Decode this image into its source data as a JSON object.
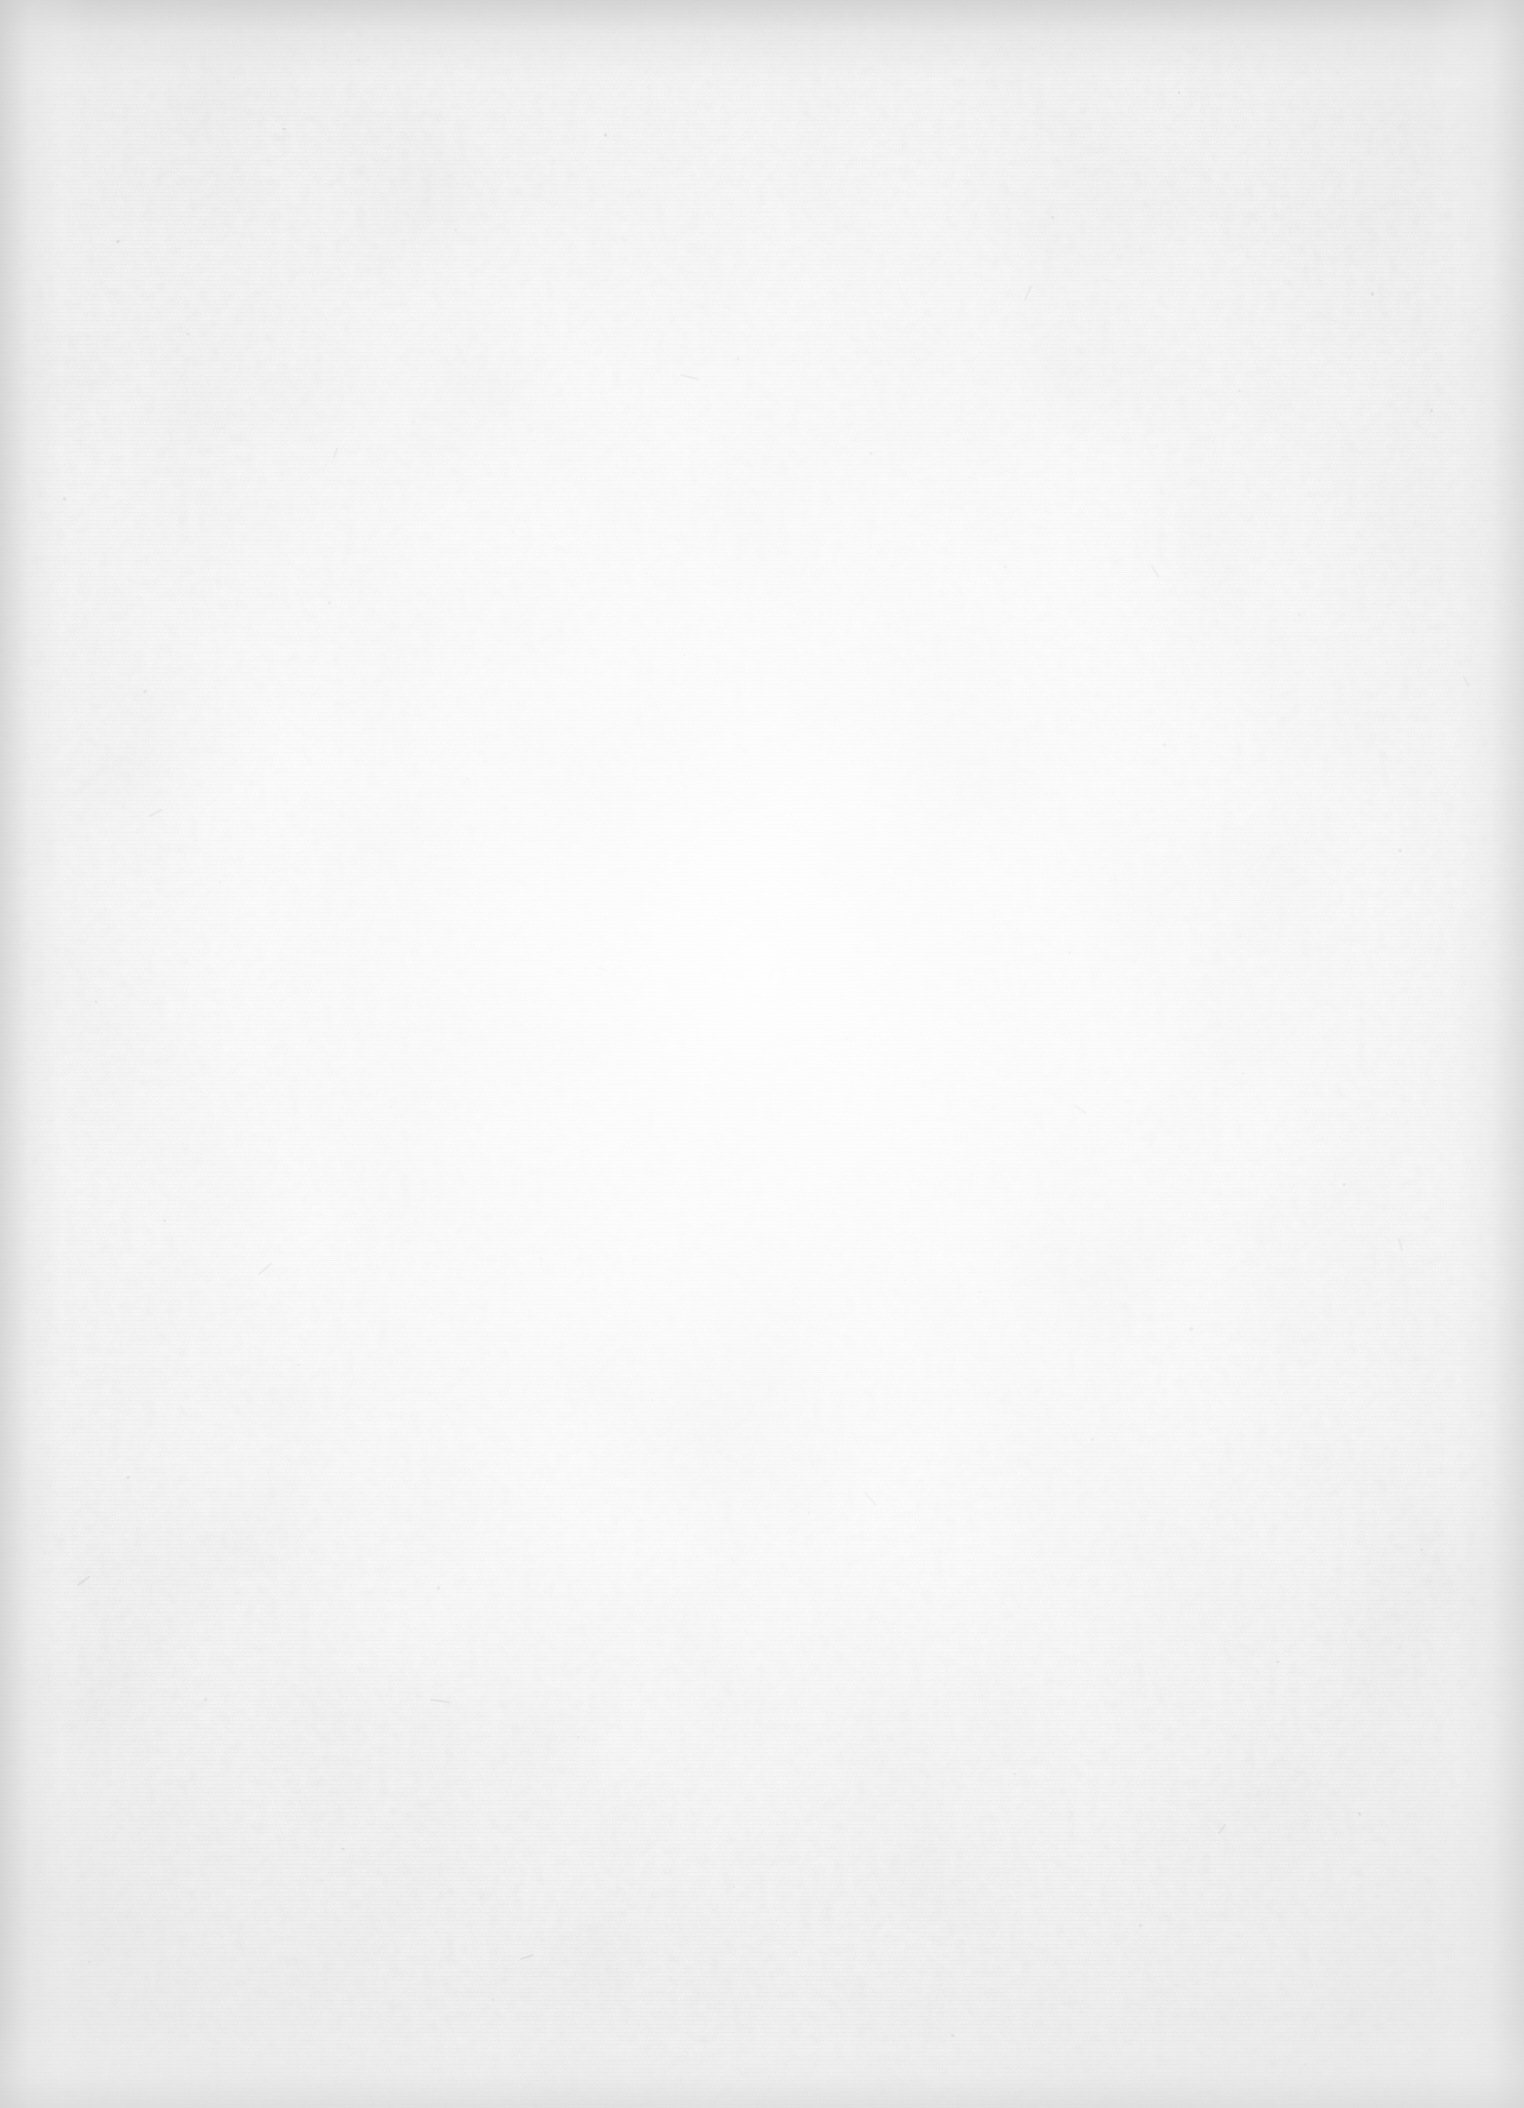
{
  "page": {
    "kind": "scanned-blank-page",
    "content_text": "",
    "visible_text_count": 0,
    "width_px": 1524,
    "height_px": 2108,
    "orientation": "portrait"
  },
  "appearance": {
    "paper_base_color": "#fcfcfc",
    "paper_center_color": "#fdfdfd",
    "paper_edge_color": "#e8e8e8",
    "corner_shadow_color": "#ececec",
    "fiber_speck_color": "#9a9a98",
    "background_color": "#ffffff"
  },
  "artifacts": {
    "vignette": "radial, brightest at center",
    "edge_shadows": [
      "top",
      "left",
      "right",
      "bottom"
    ],
    "grain": "paper fibre texture",
    "specks": "scattered dark fibre inclusions",
    "banding": "faint horizontal scanner banding"
  },
  "specks": [
    {
      "x": 604,
      "y": 133,
      "w": 3,
      "h": 4,
      "r": -22,
      "o": 0.34
    },
    {
      "x": 282,
      "y": 128,
      "w": 4,
      "h": 2,
      "r": 14,
      "o": 0.26
    },
    {
      "x": 1178,
      "y": 91,
      "w": 2,
      "h": 3,
      "r": 0,
      "o": 0.3
    },
    {
      "x": 357,
      "y": 59,
      "w": 3,
      "h": 2,
      "r": 40,
      "o": 0.24
    },
    {
      "x": 233,
      "y": 77,
      "w": 2,
      "h": 2,
      "r": 0,
      "o": 0.22
    },
    {
      "x": 116,
      "y": 240,
      "w": 4,
      "h": 3,
      "r": -35,
      "o": 0.28
    },
    {
      "x": 454,
      "y": 229,
      "w": 3,
      "h": 2,
      "r": 18,
      "o": 0.25
    },
    {
      "x": 1051,
      "y": 216,
      "w": 3,
      "h": 3,
      "r": 0,
      "o": 0.27
    },
    {
      "x": 1371,
      "y": 292,
      "w": 3,
      "h": 4,
      "r": -15,
      "o": 0.29
    },
    {
      "x": 186,
      "y": 333,
      "w": 4,
      "h": 2,
      "r": 28,
      "o": 0.23
    },
    {
      "x": 737,
      "y": 357,
      "w": 2,
      "h": 3,
      "r": 0,
      "o": 0.26
    },
    {
      "x": 1238,
      "y": 390,
      "w": 3,
      "h": 2,
      "r": -20,
      "o": 0.24
    },
    {
      "x": 412,
      "y": 421,
      "w": 2,
      "h": 2,
      "r": 0,
      "o": 0.21
    },
    {
      "x": 869,
      "y": 452,
      "w": 4,
      "h": 3,
      "r": 32,
      "o": 0.27
    },
    {
      "x": 1430,
      "y": 409,
      "w": 3,
      "h": 3,
      "r": 0,
      "o": 0.25
    },
    {
      "x": 63,
      "y": 497,
      "w": 3,
      "h": 4,
      "r": -42,
      "o": 0.28
    },
    {
      "x": 512,
      "y": 531,
      "w": 2,
      "h": 2,
      "r": 0,
      "o": 0.22
    },
    {
      "x": 1003,
      "y": 566,
      "w": 4,
      "h": 2,
      "r": 16,
      "o": 0.25
    },
    {
      "x": 328,
      "y": 601,
      "w": 3,
      "h": 3,
      "r": 0,
      "o": 0.26
    },
    {
      "x": 1298,
      "y": 613,
      "w": 2,
      "h": 3,
      "r": -12,
      "o": 0.23
    },
    {
      "x": 683,
      "y": 654,
      "w": 3,
      "h": 2,
      "r": 24,
      "o": 0.24
    },
    {
      "x": 143,
      "y": 690,
      "w": 4,
      "h": 3,
      "r": -28,
      "o": 0.29
    },
    {
      "x": 925,
      "y": 713,
      "w": 2,
      "h": 2,
      "r": 0,
      "o": 0.21
    },
    {
      "x": 1163,
      "y": 743,
      "w": 3,
      "h": 4,
      "r": 36,
      "o": 0.27
    },
    {
      "x": 466,
      "y": 778,
      "w": 3,
      "h": 2,
      "r": -18,
      "o": 0.24
    },
    {
      "x": 790,
      "y": 812,
      "w": 2,
      "h": 3,
      "r": 0,
      "o": 0.22
    },
    {
      "x": 1398,
      "y": 849,
      "w": 4,
      "h": 3,
      "r": 20,
      "o": 0.28
    },
    {
      "x": 219,
      "y": 881,
      "w": 3,
      "h": 2,
      "r": 0,
      "o": 0.23
    },
    {
      "x": 605,
      "y": 918,
      "w": 2,
      "h": 2,
      "r": 0,
      "o": 0.21
    },
    {
      "x": 1068,
      "y": 951,
      "w": 3,
      "h": 4,
      "r": -30,
      "o": 0.26
    },
    {
      "x": 94,
      "y": 1001,
      "w": 4,
      "h": 2,
      "r": 12,
      "o": 0.27
    },
    {
      "x": 845,
      "y": 1038,
      "w": 3,
      "h": 3,
      "r": 0,
      "o": 0.25
    },
    {
      "x": 1242,
      "y": 1072,
      "w": 2,
      "h": 3,
      "r": -22,
      "o": 0.23
    },
    {
      "x": 389,
      "y": 1106,
      "w": 3,
      "h": 2,
      "r": 34,
      "o": 0.24
    },
    {
      "x": 716,
      "y": 1141,
      "w": 2,
      "h": 2,
      "r": 0,
      "o": 0.21
    },
    {
      "x": 1342,
      "y": 1183,
      "w": 4,
      "h": 3,
      "r": -16,
      "o": 0.28
    },
    {
      "x": 163,
      "y": 1219,
      "w": 3,
      "h": 3,
      "r": 0,
      "o": 0.25
    },
    {
      "x": 540,
      "y": 1257,
      "w": 2,
      "h": 3,
      "r": 26,
      "o": 0.22
    },
    {
      "x": 978,
      "y": 1291,
      "w": 3,
      "h": 2,
      "r": 0,
      "o": 0.24
    },
    {
      "x": 1189,
      "y": 1327,
      "w": 4,
      "h": 4,
      "r": -38,
      "o": 0.29
    },
    {
      "x": 297,
      "y": 1364,
      "w": 3,
      "h": 2,
      "r": 18,
      "o": 0.23
    },
    {
      "x": 651,
      "y": 1399,
      "w": 2,
      "h": 2,
      "r": 0,
      "o": 0.21
    },
    {
      "x": 1091,
      "y": 1438,
      "w": 3,
      "h": 3,
      "r": 0,
      "o": 0.26
    },
    {
      "x": 126,
      "y": 1476,
      "w": 4,
      "h": 3,
      "r": -24,
      "o": 0.27
    },
    {
      "x": 808,
      "y": 1511,
      "w": 2,
      "h": 3,
      "r": 10,
      "o": 0.22
    },
    {
      "x": 1420,
      "y": 1549,
      "w": 3,
      "h": 2,
      "r": 0,
      "o": 0.25
    },
    {
      "x": 437,
      "y": 1586,
      "w": 3,
      "h": 4,
      "r": 30,
      "o": 0.26
    },
    {
      "x": 893,
      "y": 1623,
      "w": 2,
      "h": 2,
      "r": 0,
      "o": 0.21
    },
    {
      "x": 1276,
      "y": 1661,
      "w": 4,
      "h": 2,
      "r": -14,
      "o": 0.27
    },
    {
      "x": 204,
      "y": 1698,
      "w": 3,
      "h": 3,
      "r": 0,
      "o": 0.24
    },
    {
      "x": 577,
      "y": 1736,
      "w": 2,
      "h": 3,
      "r": 22,
      "o": 0.22
    },
    {
      "x": 1013,
      "y": 1773,
      "w": 3,
      "h": 2,
      "r": 0,
      "o": 0.25
    },
    {
      "x": 1358,
      "y": 1812,
      "w": 3,
      "h": 4,
      "r": -32,
      "o": 0.28
    },
    {
      "x": 341,
      "y": 1848,
      "w": 4,
      "h": 2,
      "r": 16,
      "o": 0.26
    },
    {
      "x": 733,
      "y": 1886,
      "w": 2,
      "h": 2,
      "r": 0,
      "o": 0.21
    },
    {
      "x": 1139,
      "y": 1924,
      "w": 3,
      "h": 3,
      "r": 0,
      "o": 0.24
    },
    {
      "x": 88,
      "y": 1961,
      "w": 3,
      "h": 2,
      "r": -20,
      "o": 0.23
    },
    {
      "x": 492,
      "y": 1998,
      "w": 2,
      "h": 3,
      "r": 0,
      "o": 0.22
    },
    {
      "x": 951,
      "y": 2034,
      "w": 4,
      "h": 3,
      "r": 28,
      "o": 0.27
    },
    {
      "x": 1304,
      "y": 2063,
      "w": 3,
      "h": 2,
      "r": 0,
      "o": 0.24
    }
  ],
  "fibres": [
    {
      "x": 1148,
      "y": 570,
      "w": 14,
      "h": 2,
      "r": 58,
      "o": 0.2
    },
    {
      "x": 256,
      "y": 1268,
      "w": 18,
      "h": 2,
      "r": -42,
      "o": 0.22
    },
    {
      "x": 596,
      "y": 968,
      "w": 12,
      "h": 2,
      "r": 20,
      "o": 0.18
    },
    {
      "x": 1020,
      "y": 292,
      "w": 16,
      "h": 2,
      "r": -66,
      "o": 0.19
    },
    {
      "x": 430,
      "y": 1700,
      "w": 20,
      "h": 2,
      "r": 8,
      "o": 0.21
    },
    {
      "x": 1394,
      "y": 1244,
      "w": 13,
      "h": 2,
      "r": 74,
      "o": 0.18
    },
    {
      "x": 148,
      "y": 812,
      "w": 15,
      "h": 2,
      "r": -28,
      "o": 0.2
    },
    {
      "x": 862,
      "y": 1498,
      "w": 17,
      "h": 2,
      "r": 48,
      "o": 0.19
    },
    {
      "x": 1216,
      "y": 1828,
      "w": 12,
      "h": 2,
      "r": -54,
      "o": 0.18
    },
    {
      "x": 680,
      "y": 376,
      "w": 19,
      "h": 2,
      "r": 14,
      "o": 0.2
    },
    {
      "x": 330,
      "y": 452,
      "w": 11,
      "h": 2,
      "r": -70,
      "o": 0.17
    },
    {
      "x": 1072,
      "y": 1108,
      "w": 16,
      "h": 2,
      "r": 36,
      "o": 0.19
    },
    {
      "x": 520,
      "y": 1956,
      "w": 14,
      "h": 2,
      "r": -18,
      "o": 0.2
    },
    {
      "x": 1460,
      "y": 680,
      "w": 12,
      "h": 2,
      "r": 62,
      "o": 0.18
    },
    {
      "x": 76,
      "y": 1580,
      "w": 15,
      "h": 2,
      "r": -36,
      "o": 0.21
    }
  ]
}
